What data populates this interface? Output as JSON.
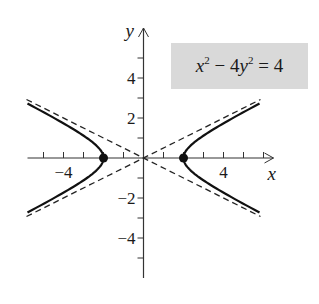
{
  "diagram": {
    "type": "hyperbola-graph",
    "equation": {
      "lhs_x": "x",
      "x_exp": "2",
      "minus": " − 4",
      "lhs_y": "y",
      "y_exp": "2",
      "rhs": " = 4"
    },
    "axes": {
      "x_label": "x",
      "y_label": "y",
      "x_tick_labels": [
        {
          "value": -4,
          "text": "−4"
        },
        {
          "value": 4,
          "text": "4"
        }
      ],
      "y_tick_labels": [
        {
          "value": 4,
          "text": "4"
        },
        {
          "value": 2,
          "text": "2"
        },
        {
          "value": -2,
          "text": "−2"
        },
        {
          "value": -4,
          "text": "−4"
        }
      ],
      "x_range": [
        -5.8,
        6.5
      ],
      "y_range": [
        -6,
        6.5
      ],
      "tick_step": 1
    },
    "vertices": [
      {
        "x": -2,
        "y": 0
      },
      {
        "x": 2,
        "y": 0
      }
    ],
    "asymptotes": [
      "y = x/2",
      "y = -x/2"
    ],
    "colors": {
      "curve": "#111111",
      "axis": "#333333",
      "equation_box": "#d9d9d9"
    }
  }
}
